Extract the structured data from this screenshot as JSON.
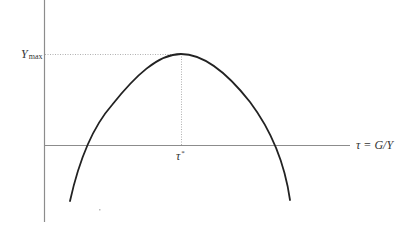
{
  "diagram": {
    "type": "laffer-curve",
    "colors": {
      "axis": "#8c8c8c",
      "curve": "#222222",
      "guide": "#b0b0b0",
      "text": "#333333"
    },
    "y_axis": {
      "tick_label_symbol": "Y",
      "tick_label_subscript": "max"
    },
    "x_axis": {
      "label": "τ = G/Y",
      "tick_label_symbol": "τ",
      "tick_label_superscript": "*"
    },
    "curve": {
      "shape": "inverted-u",
      "peak": "(τ*, Ymax)",
      "crosses_x_axis": 2
    }
  }
}
